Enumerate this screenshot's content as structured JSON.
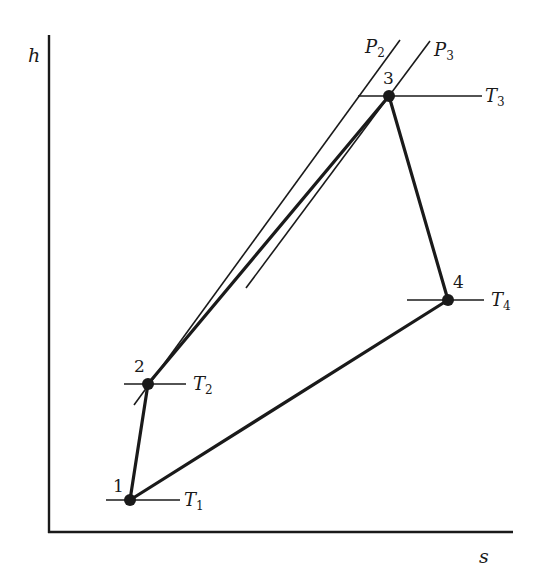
{
  "diagram": {
    "type": "h-s diagram (enthalpy vs entropy) of a thermodynamic cycle",
    "axes": {
      "y_label": "h",
      "x_label": "s",
      "origin": [
        49,
        532
      ],
      "y_top": 35,
      "x_right": 513
    },
    "points": [
      {
        "id": "1",
        "label": "1",
        "x": 130,
        "y": 500,
        "isotherm": "T1"
      },
      {
        "id": "2",
        "label": "2",
        "x": 148,
        "y": 384,
        "isotherm": "T2"
      },
      {
        "id": "3",
        "label": "3",
        "x": 389,
        "y": 96,
        "isotherm": "T3"
      },
      {
        "id": "4",
        "label": "4",
        "x": 448,
        "y": 300,
        "isotherm": "T4"
      }
    ],
    "process_path": [
      "1",
      "2",
      "3",
      "4",
      "1"
    ],
    "isotherms": [
      {
        "name": "T1",
        "base": "T",
        "sub": "1",
        "x1": 106,
        "x2": 180,
        "y": 500
      },
      {
        "name": "T2",
        "base": "T",
        "sub": "2",
        "x1": 124,
        "x2": 186,
        "y": 384
      },
      {
        "name": "T3",
        "base": "T",
        "sub": "3",
        "x1": 358,
        "x2": 482,
        "y": 96
      },
      {
        "name": "T4",
        "base": "T",
        "sub": "4",
        "x1": 407,
        "x2": 484,
        "y": 300
      }
    ],
    "isobars": [
      {
        "name": "P2",
        "base": "P",
        "sub": "2",
        "x1": 134,
        "y1": 405,
        "x2": 400,
        "y2": 40
      },
      {
        "name": "P3",
        "base": "P",
        "sub": "3",
        "x1": 246,
        "y1": 288,
        "x2": 430,
        "y2": 41
      }
    ],
    "colors": {
      "stroke": "#1a1a1a",
      "background": "#ffffff"
    }
  }
}
